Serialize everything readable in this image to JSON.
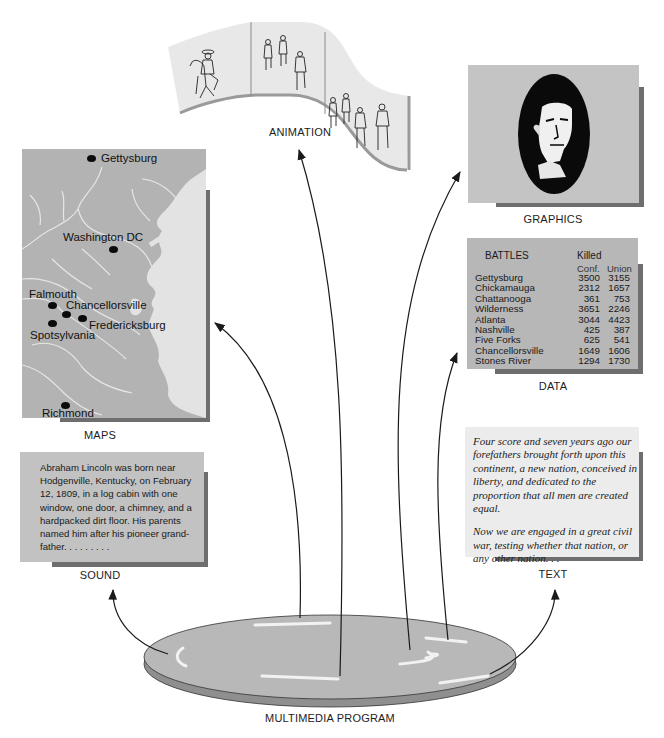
{
  "diagram": {
    "center_label": "MULTIMEDIA PROGRAM",
    "components": {
      "animation": {
        "label": "ANIMATION",
        "frames": 3,
        "content": "horse-and-rider sketches"
      },
      "graphics": {
        "label": "GRAPHICS",
        "content": "Abraham Lincoln portrait silhouette in oval"
      },
      "maps": {
        "label": "MAPS",
        "cities": [
          {
            "name": "Gettysburg"
          },
          {
            "name": "Washington DC"
          },
          {
            "name": "Falmouth"
          },
          {
            "name": "Chancellorsville"
          },
          {
            "name": "Fredericksburg"
          },
          {
            "name": "Spotsylvania"
          },
          {
            "name": "Richmond"
          }
        ]
      },
      "data": {
        "label": "DATA",
        "table": {
          "title": "BATTLES",
          "group_header": "Killed",
          "columns": [
            "Conf.",
            "Union"
          ],
          "rows": [
            {
              "battle": "Gettysburg",
              "conf": "3500",
              "union": "3155"
            },
            {
              "battle": "Chickamauga",
              "conf": "2312",
              "union": "1657"
            },
            {
              "battle": "Chattanooga",
              "conf": "361",
              "union": "753"
            },
            {
              "battle": "Wilderness",
              "conf": "3651",
              "union": "2246"
            },
            {
              "battle": "Atlanta",
              "conf": "3044",
              "union": "4423"
            },
            {
              "battle": "Nashville",
              "conf": "425",
              "union": "387"
            },
            {
              "battle": "Five Forks",
              "conf": "625",
              "union": "541"
            },
            {
              "battle": "Chancellorsville",
              "conf": "1649",
              "union": "1606"
            },
            {
              "battle": "Stones River",
              "conf": "1294",
              "union": "1730"
            }
          ]
        }
      },
      "text": {
        "label": "TEXT",
        "paragraphs": [
          "Four score and seven years ago our forefathers brought forth upon this continent, a new nation, conceived in liberty, and dedicated to the proportion that all men are created equal.",
          "Now we are engaged in a great civil war, testing whether that nation, or any other nation. . ."
        ]
      },
      "sound": {
        "label": "SOUND",
        "body": "Abraham Lincoln was born near Hodgenville, Kentucky, on February 12, 1809, in a log cabin with one window, one door, a chimney, and a hardpacked dirt floor.  His parents named him after his pioneer grand-father. . . . . . . . ."
      }
    },
    "colors": {
      "panel_gray": "#b3b3b3",
      "shadow": "#6e6e6e",
      "disk": "#b8b8b8",
      "text_panel": "#ececec",
      "arrow": "#222222"
    }
  }
}
